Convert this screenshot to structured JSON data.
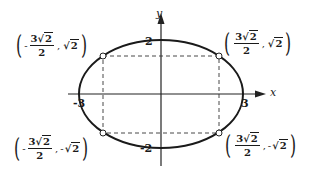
{
  "axes": {
    "x_label": "x",
    "y_label": "y",
    "ticks": {
      "x_neg": "-3",
      "x_pos": "3",
      "y_pos": "2",
      "y_neg": "-2"
    }
  },
  "ellipse": {
    "semi_major_x": 3,
    "semi_minor_y": 2,
    "stroke": "#1a1a1a"
  },
  "points": [
    {
      "id": "top-left",
      "x_sign": "-",
      "x_num": "3",
      "x_rad": "2",
      "x_den": "2",
      "y_sign": "",
      "y_rad": "2"
    },
    {
      "id": "top-right",
      "x_sign": "",
      "x_num": "3",
      "x_rad": "2",
      "x_den": "2",
      "y_sign": "",
      "y_rad": "2"
    },
    {
      "id": "bottom-left",
      "x_sign": "-",
      "x_num": "3",
      "x_rad": "2",
      "x_den": "2",
      "y_sign": "-",
      "y_rad": "2"
    },
    {
      "id": "bottom-right",
      "x_sign": "",
      "x_num": "3",
      "x_rad": "2",
      "x_den": "2",
      "y_sign": "-",
      "y_rad": "2"
    }
  ],
  "symbols": {
    "sqrt": "√",
    "comma": ",",
    "lparen": "(",
    "rparen": ")"
  }
}
